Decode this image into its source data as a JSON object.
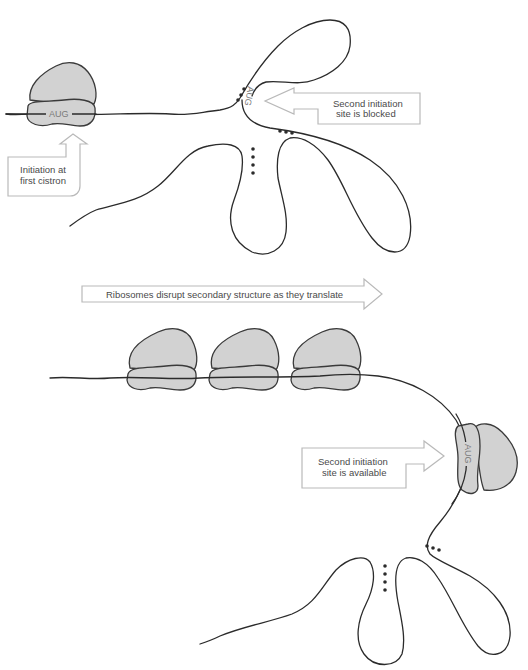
{
  "diagram": {
    "colors": {
      "ribosome_fill": "#d2d2d2",
      "outline": "#2b2b2b",
      "callout_border": "#b9b9b9",
      "label_text": "#4a4a4a"
    },
    "top_panel": {
      "ribosome_codon": "AUG",
      "blocked_codon": "AUG",
      "callout_initiation": {
        "line1": "Initiation at",
        "line2": "first cistron"
      },
      "callout_blocked": {
        "line1": "Second initiation",
        "line2": "site is blocked"
      }
    },
    "translate_arrow": {
      "label": "Ribosomes disrupt secondary structure as they translate"
    },
    "bottom_panel": {
      "ribosome_count": 3,
      "second_ribosome_codon": "AUG",
      "callout_available": {
        "line1": "Second initiation",
        "line2": "site is available"
      }
    }
  }
}
